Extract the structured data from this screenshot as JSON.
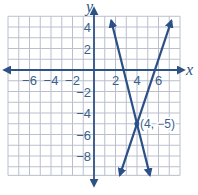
{
  "chart_data": {
    "type": "line",
    "title": "",
    "xlabel": "x",
    "ylabel": "y",
    "xlim": [
      -8,
      8
    ],
    "ylim": [
      -10,
      5
    ],
    "grid": true,
    "x_ticks": [
      -6,
      -4,
      -2,
      2,
      4,
      6
    ],
    "y_ticks": [
      4,
      2,
      -2,
      -4,
      -6,
      -8
    ],
    "x_tick_labels": [
      "−6",
      "−4",
      "−2",
      "2",
      "4",
      "6"
    ],
    "y_tick_labels": [
      "4",
      "2",
      "−2",
      "−4",
      "−6",
      "−8"
    ],
    "series": [
      {
        "name": "line A",
        "equation": "y = -4x + 11",
        "points": [
          [
            1.6,
            4.6
          ],
          [
            4,
            -5
          ],
          [
            5.2,
            -9.8
          ]
        ]
      },
      {
        "name": "line B",
        "equation": "y = 3x - 17",
        "points": [
          [
            7.2,
            4.6
          ],
          [
            4,
            -5
          ],
          [
            2.4,
            -9.8
          ]
        ]
      }
    ],
    "annotations": [
      {
        "text": "(4, −5)",
        "x": 4,
        "y": -5
      }
    ],
    "colors": {
      "line": "#2b4f86",
      "grid": "#b9c0cc",
      "axis": "#2f5285",
      "text": "#3b5f8c"
    }
  },
  "labels": {
    "x_axis": "x",
    "y_axis": "y",
    "intersection": "(4, −5)"
  }
}
